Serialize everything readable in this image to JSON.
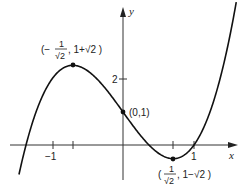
{
  "chart_data": {
    "type": "line",
    "title": "",
    "function": "y = 2x^3 - 3x + 1",
    "xlabel": "x",
    "ylabel": "y",
    "xlim": [
      -1.5,
      1.6
    ],
    "ylim": [
      -0.9,
      4.1
    ],
    "x_ticks": [
      {
        "value": -1,
        "label": "−1"
      },
      {
        "value": -0.7071,
        "label": ""
      },
      {
        "value": 0.7071,
        "label": ""
      },
      {
        "value": 1,
        "label": "1"
      }
    ],
    "y_ticks": [
      {
        "value": 2,
        "label": "2"
      }
    ],
    "grid": false,
    "series": [
      {
        "name": "curve",
        "x": [
          -1.5,
          -1.366,
          -1.0,
          -0.7071,
          -0.5,
          0.0,
          0.5,
          0.7071,
          1.0,
          1.3,
          1.6
        ],
        "y": [
          -1.25,
          0.0,
          2.0,
          2.414,
          2.25,
          1.0,
          -0.25,
          -0.414,
          0.0,
          1.494,
          4.392
        ]
      }
    ],
    "annotations": [
      {
        "point": [
          -0.7071,
          2.4142
        ],
        "label_text": "(−1/√2 , 1+√2)",
        "label_num": "1",
        "label_den": "√2",
        "prefix": "(−",
        "suffix": ", 1+√2 )"
      },
      {
        "point": [
          0,
          1
        ],
        "label_text": "(0,1)"
      },
      {
        "point": [
          0.7071,
          -0.4142
        ],
        "label_text": "(1/√2 , 1−√2)",
        "label_num": "1",
        "label_den": "√2",
        "prefix": "(",
        "suffix": ", 1−√2 )"
      }
    ]
  },
  "labels": {
    "x_axis": "x",
    "y_axis": "y",
    "tick_neg1": "−1",
    "tick_1": "1",
    "tick_2": "2",
    "max_prefix": "(−",
    "max_num": "1",
    "max_den": "√2",
    "max_suffix": ", 1+√2 )",
    "intercept": "(0,1)",
    "min_prefix": "(",
    "min_num": "1",
    "min_den": "√2",
    "min_suffix": ", 1−√2 )"
  }
}
